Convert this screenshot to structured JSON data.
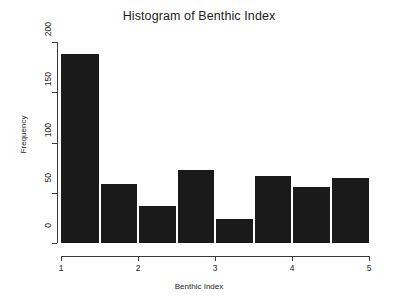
{
  "chart_data": {
    "type": "bar",
    "title": "Histogram of Benthic Index",
    "xlabel": "Benthic Index",
    "ylabel": "Frequency",
    "bin_width": 0.5,
    "bin_edges": [
      1,
      1.5,
      2,
      2.5,
      3,
      3.5,
      4,
      4.5,
      5
    ],
    "categories": [
      "1-1.5",
      "1.5-2",
      "2-2.5",
      "2.5-3",
      "3-3.5",
      "3.5-4",
      "4-4.5",
      "4.5-5"
    ],
    "values": [
      188,
      59,
      37,
      73,
      24,
      67,
      56,
      65
    ],
    "x_ticks": [
      1,
      2,
      3,
      4,
      5
    ],
    "x_tick_labels": [
      "1",
      "2",
      "3",
      "4",
      "5"
    ],
    "y_ticks": [
      0,
      50,
      100,
      150,
      200
    ],
    "y_tick_labels": [
      "0",
      "50",
      "100",
      "150",
      "200"
    ],
    "xlim": [
      1,
      5
    ],
    "ylim": [
      0,
      200
    ],
    "grid": false,
    "legend": false,
    "bar_color": "#1a1a1a",
    "bar_border_color": "#ffffff",
    "axis_color": "#3b3b3b",
    "background": "#ffffff"
  },
  "labels": {
    "title": "Histogram of Benthic Index",
    "x_axis_title": "Benthic Index",
    "y_axis_title": "Frequency"
  }
}
